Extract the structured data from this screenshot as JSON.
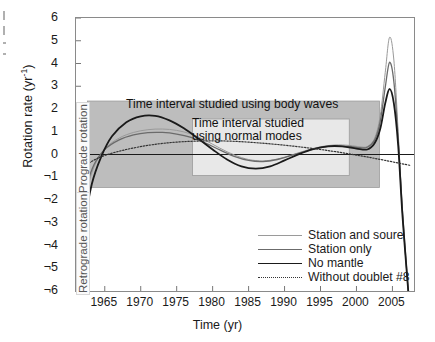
{
  "axes": {
    "ylabel_text": "Rotation rate (yr",
    "ylabel_sup": "-1",
    "ylabel_close": ")",
    "xlabel": "Time (yr)",
    "yticks": [
      "6",
      "5",
      "4",
      "3",
      "2",
      "1",
      "0",
      "¬1",
      "¬2",
      "¬3",
      "¬4",
      "¬5",
      "¬6"
    ],
    "xticks": [
      "1965",
      "1970",
      "1975",
      "1980",
      "1985",
      "1990",
      "1995",
      "2000",
      "2005"
    ]
  },
  "annotations": {
    "body_waves": "Time interval studied using body waves",
    "normal_modes_line1": "Time interval studied",
    "normal_modes_line2": "using normal modes",
    "prograde": "Prograde rotation",
    "retrograde": "Retrograde rotation"
  },
  "legend": {
    "items": [
      {
        "label": "Station and soure",
        "color": "#9a9a9a",
        "width": 1.0,
        "dash": "none"
      },
      {
        "label": "Station only",
        "color": "#6b6b6b",
        "width": 1.3,
        "dash": "none"
      },
      {
        "label": "No mantle",
        "color": "#1a1a1a",
        "width": 1.8,
        "dash": "none"
      },
      {
        "label": "Without doublet #8",
        "color": "#333333",
        "width": 1.2,
        "dash": "dotted"
      }
    ]
  },
  "chart_data": {
    "type": "line",
    "title": "",
    "xlabel": "Time (yr)",
    "ylabel": "Rotation rate (yr^-1)",
    "xlim": [
      1961,
      2008
    ],
    "ylim": [
      -6,
      6
    ],
    "grid": false,
    "legend_position": "bottom-right",
    "shaded_regions": [
      {
        "name": "body-waves-interval",
        "x": [
          1962.6,
          2003.2
        ],
        "y": [
          -1.45,
          2.35
        ],
        "color": "#bdbdbd"
      },
      {
        "name": "normal-modes-interval",
        "x": [
          1977.2,
          1999.0
        ],
        "y": [
          -0.92,
          1.56
        ],
        "color": "#e8e8e8"
      }
    ],
    "zero_line": 0,
    "series": [
      {
        "name": "Station and soure",
        "color": "#9a9a9a",
        "x": [
          1961.5,
          1962.5,
          1963.5,
          1965,
          1967,
          1969,
          1971,
          1973,
          1975,
          1977,
          1979,
          1981,
          1983,
          1985,
          1987,
          1989,
          1991,
          1993,
          1995,
          1997,
          1999,
          2000.5,
          2001.5,
          2002.5,
          2003.3,
          2004.0,
          2004.6,
          2005.2,
          2005.8,
          2006.4,
          2007.2
        ],
        "y": [
          -3.0,
          -1.6,
          -0.55,
          0.25,
          0.72,
          0.97,
          1.09,
          1.12,
          1.06,
          0.9,
          0.62,
          0.28,
          -0.02,
          -0.22,
          -0.28,
          -0.2,
          -0.02,
          0.18,
          0.34,
          0.42,
          0.4,
          0.34,
          0.35,
          0.7,
          1.7,
          3.6,
          5.15,
          4.15,
          1.0,
          -2.6,
          -6.0
        ]
      },
      {
        "name": "Station only",
        "color": "#6b6b6b",
        "x": [
          1961.5,
          1962.5,
          1963.5,
          1965,
          1967,
          1969,
          1971,
          1973,
          1975,
          1977,
          1979,
          1981,
          1983,
          1985,
          1987,
          1989,
          1991,
          1993,
          1995,
          1997,
          1999,
          2000.5,
          2001.5,
          2002.5,
          2003.3,
          2004.0,
          2004.6,
          2005.2,
          2005.8,
          2006.4,
          2007.2
        ],
        "y": [
          -2.6,
          -1.35,
          -0.45,
          0.22,
          0.64,
          0.86,
          0.96,
          0.97,
          0.9,
          0.75,
          0.5,
          0.2,
          -0.08,
          -0.26,
          -0.31,
          -0.22,
          -0.04,
          0.15,
          0.3,
          0.38,
          0.36,
          0.3,
          0.32,
          0.62,
          1.45,
          2.95,
          4.05,
          3.2,
          0.7,
          -2.5,
          -6.0
        ]
      },
      {
        "name": "No mantle",
        "color": "#1a1a1a",
        "x": [
          1961.3,
          1962.2,
          1963.2,
          1964.5,
          1966,
          1968,
          1970,
          1972,
          1974,
          1976,
          1978,
          1980,
          1982,
          1984,
          1986,
          1988,
          1990,
          1992,
          1994,
          1996,
          1998,
          2000,
          2001.5,
          2002.5,
          2003.3,
          2004.0,
          2004.6,
          2005.2,
          2005.8,
          2006.4,
          2007.2
        ],
        "y": [
          -6.0,
          -3.1,
          -1.3,
          -0.1,
          0.8,
          1.42,
          1.68,
          1.7,
          1.5,
          1.15,
          0.7,
          0.22,
          -0.22,
          -0.52,
          -0.62,
          -0.52,
          -0.26,
          0.02,
          0.24,
          0.36,
          0.36,
          0.26,
          0.22,
          0.48,
          1.12,
          2.25,
          2.88,
          2.25,
          0.4,
          -2.7,
          -6.0
        ]
      },
      {
        "name": "Without doublet #8",
        "color": "#333333",
        "dash": "dotted",
        "x": [
          1961.5,
          1963,
          1965,
          1968,
          1971,
          1974,
          1977,
          1980,
          1983,
          1986,
          1989,
          1992,
          1995,
          1998,
          2001,
          2004,
          2007.5
        ],
        "y": [
          -0.7,
          -0.34,
          -0.04,
          0.22,
          0.4,
          0.52,
          0.58,
          0.6,
          0.58,
          0.52,
          0.44,
          0.34,
          0.22,
          0.08,
          -0.08,
          -0.26,
          -0.48
        ]
      }
    ]
  }
}
